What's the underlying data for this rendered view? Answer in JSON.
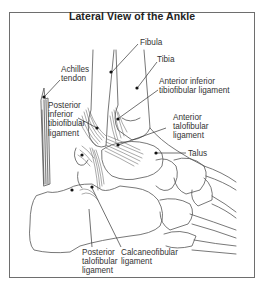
{
  "title": "Lateral View of the Ankle",
  "colors": {
    "frame": "#6e6e6e",
    "line": "#555555",
    "text": "#333333",
    "background": "#ffffff"
  },
  "labels": {
    "fibula": "Fibula",
    "tibia": "Tibia",
    "achilles": "Achilles\ntendon",
    "anterior_inferior_tibiofibular": "Anterior inferior\ntibiofibular ligament",
    "posterior_inferior_tibiofibular": "Posterior\ninferior\ntibiofibular\nligament",
    "anterior_talofibular": "Anterior\ntalofibular\nligament",
    "talus": "Talus",
    "posterior_talofibular": "Posterior\ntalofibular\nligament",
    "calcaneofibular": "Calcaneofibular\nligament"
  }
}
